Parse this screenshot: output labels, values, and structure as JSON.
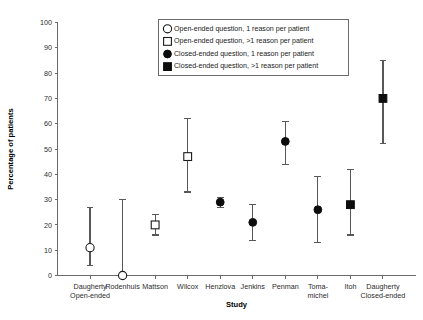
{
  "chart_data": {
    "type": "scatter",
    "title": "",
    "xlabel": "Study",
    "ylabel": "Percentage of patients",
    "ylim": [
      0,
      100
    ],
    "ytick_step": 10,
    "ytick_labels": [
      "0",
      "10",
      "20",
      "30",
      "40",
      "50",
      "60",
      "70",
      "80",
      "90",
      "100"
    ],
    "grid": false,
    "legend_position": "top-center",
    "legend": [
      {
        "marker": "open-circle",
        "label": "Open-ended question, 1 reason per patient"
      },
      {
        "marker": "open-square",
        "label": "Open-ended question, >1 reason per patient"
      },
      {
        "marker": "filled-circle",
        "label": "Closed-ended question, 1 reason per patient"
      },
      {
        "marker": "filled-square",
        "label": "Closed-ended question, >1 reason per patient"
      }
    ],
    "categories": [
      "Daugherty Open-ended",
      "Rodenhuis",
      "Mattson",
      "Wilcox",
      "Henzlova",
      "Jenkins",
      "Penman",
      "Toma-michel",
      "Itoh",
      "Daugherty Closed-ended"
    ],
    "category_label_lines": [
      [
        "Daugherty",
        "Open-ended"
      ],
      [
        "Rodenhuis",
        ""
      ],
      [
        "Mattson",
        ""
      ],
      [
        "Wilcox",
        ""
      ],
      [
        "Henzlova",
        ""
      ],
      [
        "Jenkins",
        ""
      ],
      [
        "Penman",
        ""
      ],
      [
        "Toma-",
        "michel"
      ],
      [
        "Itoh",
        ""
      ],
      [
        "Daugherty",
        "Closed-ended"
      ]
    ],
    "points": [
      {
        "study": "Daugherty Open-ended",
        "value": 11,
        "low": 4,
        "high": 27,
        "marker": "open-circle"
      },
      {
        "study": "Rodenhuis",
        "value": 0,
        "low": 0,
        "high": 30,
        "marker": "open-circle"
      },
      {
        "study": "Mattson",
        "value": 20,
        "low": 16,
        "high": 24,
        "marker": "open-square"
      },
      {
        "study": "Wilcox",
        "value": 47,
        "low": 33,
        "high": 62,
        "marker": "open-square"
      },
      {
        "study": "Henzlova",
        "value": 29,
        "low": 27,
        "high": 31,
        "marker": "filled-circle"
      },
      {
        "study": "Jenkins",
        "value": 21,
        "low": 14,
        "high": 28,
        "marker": "filled-circle"
      },
      {
        "study": "Penman",
        "value": 53,
        "low": 44,
        "high": 61,
        "marker": "filled-circle"
      },
      {
        "study": "Toma-michel",
        "value": 26,
        "low": 13,
        "high": 39,
        "marker": "filled-circle"
      },
      {
        "study": "Itoh",
        "value": 28,
        "low": 16,
        "high": 42,
        "marker": "filled-square"
      },
      {
        "study": "Daugherty Closed-ended",
        "value": 70,
        "low": 52,
        "high": 85,
        "marker": "filled-square"
      }
    ]
  },
  "colors": {
    "axis": "#6b6b6b",
    "marker_fill": "#0d0d0d",
    "marker_open": "#ffffff",
    "error_bar": "#585858",
    "text": "#1a1a1a",
    "background": "#ffffff"
  }
}
